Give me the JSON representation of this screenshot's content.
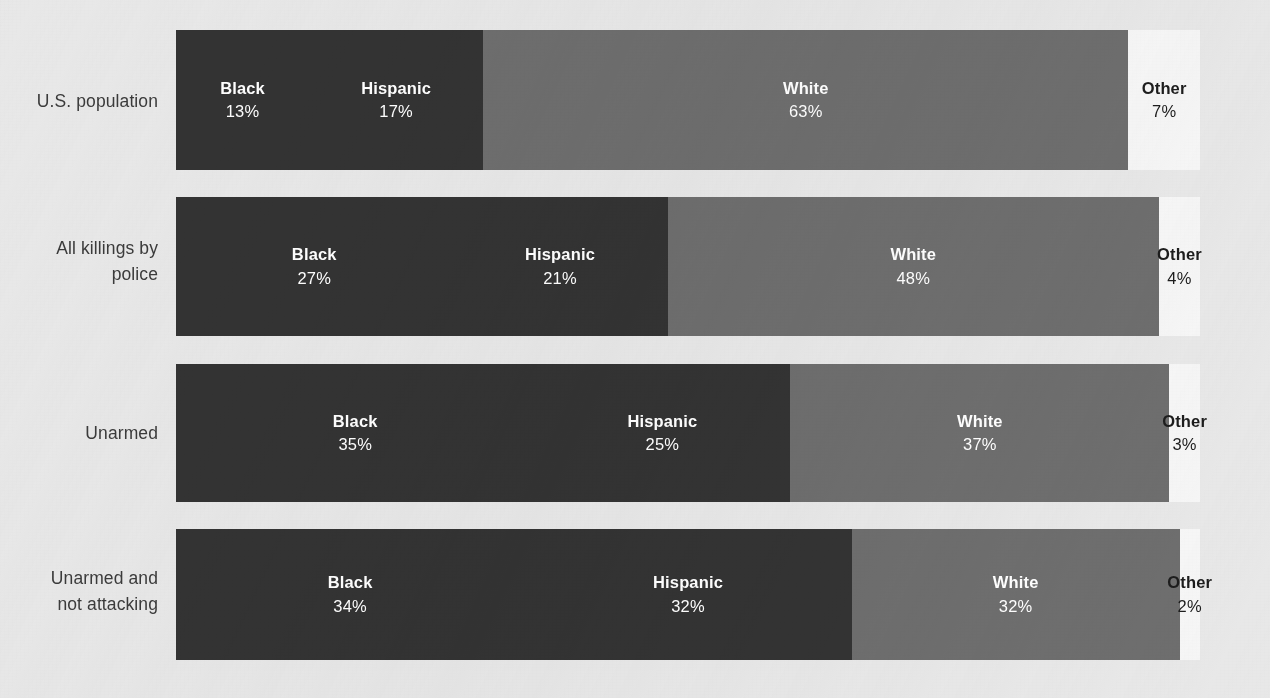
{
  "chart_data": {
    "type": "bar",
    "subtype": "horizontal-100pct-stacked",
    "title": "",
    "subtitle": "",
    "xlabel": "",
    "ylabel": "",
    "xlim": [
      0,
      100
    ],
    "grid": false,
    "legend": "none (segments labeled in place)",
    "value_suffix": "%",
    "categories": [
      "U.S. population",
      "All killings by police",
      "Unarmed",
      "Unarmed and not attacking"
    ],
    "series": [
      {
        "name": "Black",
        "values": [
          13,
          27,
          35,
          34
        ]
      },
      {
        "name": "Hispanic",
        "values": [
          17,
          21,
          25,
          32
        ]
      },
      {
        "name": "White",
        "values": [
          63,
          48,
          37,
          32
        ]
      },
      {
        "name": "Other",
        "values": [
          7,
          4,
          3,
          2
        ]
      }
    ],
    "colors": {
      "Black": "#333333",
      "Hispanic": "#333333",
      "White": "#6e6e6e",
      "Other": "#f6f6f6",
      "background": "#e8e8e8",
      "label_text": "#3b3b3b",
      "on_dark_text": "#ffffff",
      "on_light_text": "#1d1d1d"
    }
  },
  "rows": [
    {
      "label": "U.S. population",
      "top": 30,
      "height": 140,
      "label_top": 88,
      "segments": [
        {
          "name": "Black",
          "pct": "13%",
          "value": 13,
          "tone": "tone-dark",
          "overflow": false
        },
        {
          "name": "Hispanic",
          "pct": "17%",
          "value": 17,
          "tone": "tone-dark",
          "overflow": false
        },
        {
          "name": "White",
          "pct": "63%",
          "value": 63,
          "tone": "tone-mid",
          "overflow": false
        },
        {
          "name": "Other",
          "pct": "7%",
          "value": 7,
          "tone": "tone-light",
          "overflow": false
        }
      ]
    },
    {
      "label": "All killings by\npolice",
      "top": 197,
      "height": 139,
      "label_top": 235,
      "segments": [
        {
          "name": "Black",
          "pct": "27%",
          "value": 27,
          "tone": "tone-dark",
          "overflow": false
        },
        {
          "name": "Hispanic",
          "pct": "21%",
          "value": 21,
          "tone": "tone-dark",
          "overflow": false
        },
        {
          "name": "White",
          "pct": "48%",
          "value": 48,
          "tone": "tone-mid",
          "overflow": false
        },
        {
          "name": "Other",
          "pct": "4%",
          "value": 4,
          "tone": "tone-light",
          "overflow": true
        }
      ]
    },
    {
      "label": "Unarmed",
      "top": 364,
      "height": 138,
      "label_top": 420,
      "segments": [
        {
          "name": "Black",
          "pct": "35%",
          "value": 35,
          "tone": "tone-dark",
          "overflow": false
        },
        {
          "name": "Hispanic",
          "pct": "25%",
          "value": 25,
          "tone": "tone-dark",
          "overflow": false
        },
        {
          "name": "White",
          "pct": "37%",
          "value": 37,
          "tone": "tone-mid",
          "overflow": false
        },
        {
          "name": "Other",
          "pct": "3%",
          "value": 3,
          "tone": "tone-light",
          "overflow": true
        }
      ]
    },
    {
      "label": "Unarmed and\nnot attacking",
      "top": 529,
      "height": 131,
      "label_top": 565,
      "segments": [
        {
          "name": "Black",
          "pct": "34%",
          "value": 34,
          "tone": "tone-dark",
          "overflow": false
        },
        {
          "name": "Hispanic",
          "pct": "32%",
          "value": 32,
          "tone": "tone-dark",
          "overflow": false
        },
        {
          "name": "White",
          "pct": "32%",
          "value": 32,
          "tone": "tone-mid",
          "overflow": false
        },
        {
          "name": "Other",
          "pct": "2%",
          "value": 2,
          "tone": "tone-light",
          "overflow": true
        }
      ]
    }
  ]
}
